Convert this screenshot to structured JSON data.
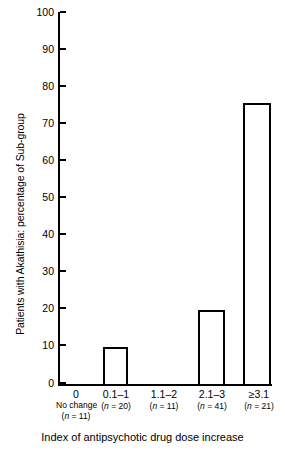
{
  "chart_data": {
    "type": "bar",
    "title": "",
    "xlabel": "Index of antipsychotic drug dose increase",
    "ylabel": "Patients with Akathisia: percentage of Sub-group",
    "categories": [
      "0",
      "0.1–1",
      "1.1–2",
      "2.1–3",
      "≥3.1"
    ],
    "category_sublabels": [
      "No change",
      "",
      "",
      "",
      ""
    ],
    "group_sizes": [
      "(n = 11)",
      "(n = 20)",
      "(n = 11)",
      "(n = 41)",
      "(n = 21)"
    ],
    "values": [
      0,
      10,
      0,
      20,
      75.5
    ],
    "ylim": [
      0,
      100
    ],
    "yticks": [
      0,
      10,
      20,
      30,
      40,
      50,
      60,
      70,
      80,
      90,
      100
    ],
    "ytick_labels": [
      "0",
      "10",
      "20",
      "30",
      "40",
      "50",
      "60",
      "70",
      "80",
      "90",
      "100"
    ],
    "grid": false,
    "legend": null,
    "bar_fill_color": "#ffffff",
    "bar_edge_color": "#000000",
    "axis_color": "#000000",
    "background_color": "#ffffff"
  }
}
